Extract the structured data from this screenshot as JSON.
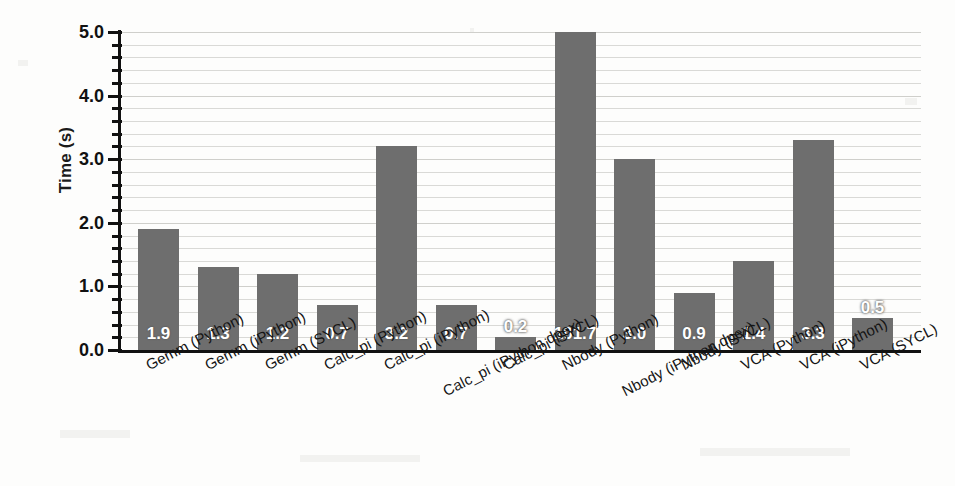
{
  "chart_data": {
    "type": "bar",
    "title": "",
    "xlabel": "",
    "ylabel": "Time (s)",
    "ylim": [
      0.0,
      5.0
    ],
    "ytick_labels": [
      "0.0",
      "1.0",
      "2.0",
      "3.0",
      "4.0",
      "5.0"
    ],
    "ytick_values": [
      0.0,
      1.0,
      2.0,
      3.0,
      4.0,
      5.0
    ],
    "minor_tick_interval": 0.2,
    "grid": true,
    "grid_axis": "y",
    "legend": false,
    "bar_color": "#6e6e6e",
    "axis_color": "#111111",
    "grid_color": "#d9d9d6",
    "background_color": "#fdfdfc",
    "value_label_color": "#ffffff",
    "categories": [
      "Gemm (Python)",
      "Gemm (iPython)",
      "Gemm (SYCL)",
      "Calc_pi (Python)",
      "Calc_pi (iPython)",
      "Calc_pi (iPython dpex)",
      "Calc_pi (SYCL)",
      "Nbody (Python)",
      "Nbody (iPython dpex)",
      "Nbody (SYCL)",
      "VCA (Python)",
      "VCA (iPython)",
      "VCA (SYCL)"
    ],
    "values": [
      1.9,
      1.3,
      1.2,
      0.7,
      3.2,
      0.7,
      0.2,
      101.7,
      3.0,
      0.9,
      1.4,
      3.3,
      0.5
    ],
    "value_labels": [
      "1.9",
      "1.3",
      "1.2",
      "0.7",
      "3.2",
      "0.7",
      "0.2",
      "101.7",
      "3.0",
      "0.9",
      "1.4",
      "3.3",
      "0.5"
    ]
  }
}
